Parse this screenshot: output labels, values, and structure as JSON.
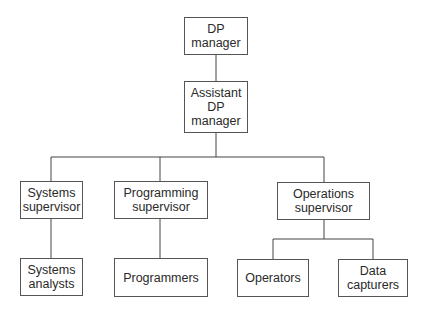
{
  "diagram": {
    "type": "org-chart",
    "nodes": {
      "dp_manager": {
        "label": "DP\nmanager"
      },
      "assistant_dp_manager": {
        "label": "Assistant\nDP\nmanager"
      },
      "systems_supervisor": {
        "label": "Systems\nsupervisor"
      },
      "programming_supervisor": {
        "label": "Programming\nsupervisor"
      },
      "operations_supervisor": {
        "label": "Operations\nsupervisor"
      },
      "systems_analysts": {
        "label": "Systems\nanalysts"
      },
      "programmers": {
        "label": "Programmers"
      },
      "operators": {
        "label": "Operators"
      },
      "data_capturers": {
        "label": "Data\ncapturers"
      }
    },
    "edges": [
      [
        "dp_manager",
        "assistant_dp_manager"
      ],
      [
        "assistant_dp_manager",
        "systems_supervisor"
      ],
      [
        "assistant_dp_manager",
        "programming_supervisor"
      ],
      [
        "assistant_dp_manager",
        "operations_supervisor"
      ],
      [
        "systems_supervisor",
        "systems_analysts"
      ],
      [
        "programming_supervisor",
        "programmers"
      ],
      [
        "operations_supervisor",
        "operators"
      ],
      [
        "operations_supervisor",
        "data_capturers"
      ]
    ]
  }
}
